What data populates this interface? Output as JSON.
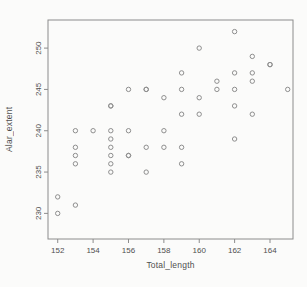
{
  "figure": {
    "background": "#fbfbfa",
    "axis_color": "#8c8c8c",
    "marker_color": "#8e8e8e",
    "text_color": "#4f4f4f"
  },
  "chart_data": {
    "type": "scatter",
    "title": "",
    "xlabel": "Total_length",
    "ylabel": "Alar_extent",
    "xlim": [
      151.45,
      165.3
    ],
    "ylim": [
      226.9,
      253.4
    ],
    "xticks": [
      152,
      154,
      156,
      158,
      160,
      162,
      164
    ],
    "yticks": [
      230,
      235,
      240,
      245,
      250
    ],
    "grid": false,
    "legend": null,
    "marker": "open-circle",
    "marker_radius": 2.2,
    "points": [
      [
        156,
        245
      ],
      [
        154,
        240
      ],
      [
        153,
        240
      ],
      [
        153,
        236
      ],
      [
        155,
        243
      ],
      [
        163,
        247
      ],
      [
        157,
        238
      ],
      [
        155,
        239
      ],
      [
        164,
        248
      ],
      [
        158,
        238
      ],
      [
        158,
        240
      ],
      [
        160,
        244
      ],
      [
        161,
        246
      ],
      [
        157,
        245
      ],
      [
        157,
        235
      ],
      [
        156,
        237
      ],
      [
        158,
        244
      ],
      [
        153,
        238
      ],
      [
        155,
        236
      ],
      [
        163,
        246
      ],
      [
        159,
        236
      ],
      [
        155,
        240
      ],
      [
        156,
        240
      ],
      [
        160,
        242
      ],
      [
        152,
        232
      ],
      [
        160,
        250
      ],
      [
        155,
        237
      ],
      [
        157,
        245
      ],
      [
        165,
        245
      ],
      [
        153,
        231
      ],
      [
        162,
        239
      ],
      [
        162,
        243
      ],
      [
        159,
        245
      ],
      [
        159,
        247
      ],
      [
        155,
        243
      ],
      [
        162,
        252
      ],
      [
        152,
        230
      ],
      [
        159,
        242
      ],
      [
        155,
        238
      ],
      [
        163,
        249
      ],
      [
        163,
        242
      ],
      [
        156,
        237
      ],
      [
        159,
        238
      ],
      [
        161,
        245
      ],
      [
        155,
        235
      ],
      [
        162,
        247
      ],
      [
        153,
        237
      ],
      [
        162,
        245
      ],
      [
        164,
        248
      ]
    ]
  }
}
